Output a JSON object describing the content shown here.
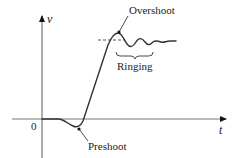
{
  "diagram": {
    "type": "signal-response-waveform",
    "axes": {
      "y_label": "v",
      "x_label": "t",
      "origin_label": "0"
    },
    "annotations": {
      "overshoot": "Overshoot",
      "ringing": "Ringing",
      "preshoot": "Preshoot"
    },
    "colors": {
      "line": "#333333",
      "axis": "#555555",
      "text": "#222222",
      "background": "#ffffff"
    }
  }
}
